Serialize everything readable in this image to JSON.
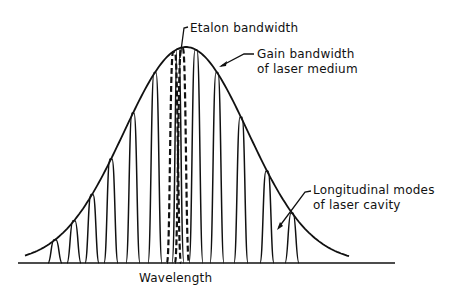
{
  "diagram": {
    "labels": {
      "etalon": "Etalon bandwidth",
      "gain_line1": "Gain bandwidth",
      "gain_line2": "of laser medium",
      "modes_line1": "Longitudinal modes",
      "modes_line2": "of laser cavity",
      "xaxis": "Wavelength"
    },
    "colors": {
      "ink": "#111111",
      "background": "#ffffff"
    },
    "baseline_y": 263,
    "gain_curve": {
      "center_x": 186,
      "peak_y": 47,
      "sigma": 62
    },
    "modes_x": [
      55,
      74,
      92,
      111,
      133,
      155,
      196,
      217,
      241,
      267,
      292
    ],
    "etalon_x": [
      174,
      182
    ]
  }
}
